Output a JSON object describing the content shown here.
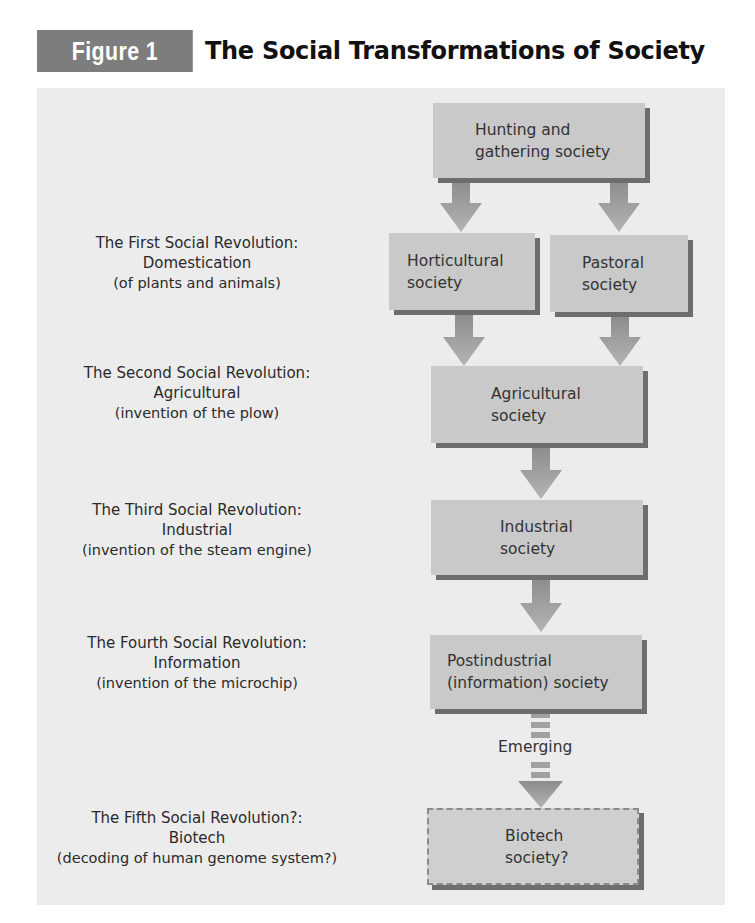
{
  "figure": {
    "badge": "Figure 1",
    "title": "The Social Transformations of Society"
  },
  "revolutions": [
    {
      "heading": "The First Social Revolution:",
      "name": "Domestication",
      "note": "(of plants and animals)"
    },
    {
      "heading": "The Second Social Revolution:",
      "name": "Agricultural",
      "note": "(invention of the plow)"
    },
    {
      "heading": "The Third Social Revolution:",
      "name": "Industrial",
      "note": "(invention of the steam engine)"
    },
    {
      "heading": "The Fourth Social Revolution:",
      "name": "Information",
      "note": "(invention of the microchip)"
    },
    {
      "heading": "The Fifth Social Revolution?:",
      "name": "Biotech",
      "note": "(decoding of human genome system?)"
    }
  ],
  "societies": {
    "hunting": [
      "Hunting and",
      "gathering society"
    ],
    "horticultural": [
      "Horticultural",
      "society"
    ],
    "pastoral": [
      "Pastoral",
      "society"
    ],
    "agricultural": [
      "Agricultural",
      "society"
    ],
    "industrial": [
      "Industrial",
      "society"
    ],
    "postindustrial": [
      "Postindustrial",
      "(information) society"
    ],
    "biotech": [
      "Biotech",
      "society?"
    ]
  },
  "connector_label": "Emerging",
  "colors": {
    "badge_bg": "#7d7d7d",
    "panel_bg": "#ececec",
    "box_bg": "#c9c9c9",
    "box_shadow": "#6d6d6d",
    "arrow": "#9a9a9a"
  }
}
